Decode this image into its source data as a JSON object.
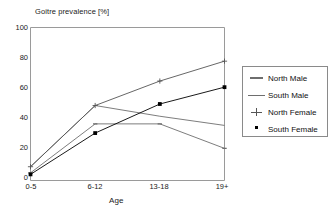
{
  "chart_data": {
    "type": "line",
    "title": "Goitre prevalence [%]",
    "xlabel": "Age",
    "ylabel": "",
    "categories": [
      "0-5",
      "6-12",
      "13-18",
      "19+"
    ],
    "ylim": [
      0,
      100
    ],
    "yticks": [
      0,
      20,
      40,
      60,
      80,
      100
    ],
    "grid": false,
    "legend_position": "right-outside",
    "series": [
      {
        "name": "North Male",
        "values": [
          5,
          37,
          37,
          21
        ],
        "marker": "dash",
        "color": "#6e6e6e"
      },
      {
        "name": "South Male",
        "values": [
          9,
          49,
          42,
          36
        ],
        "marker": "line",
        "color": "#6e6e6e"
      },
      {
        "name": "North Female",
        "values": [
          9,
          49,
          65,
          78
        ],
        "marker": "plus",
        "color": "#555555"
      },
      {
        "name": "South Female",
        "values": [
          4,
          31,
          50,
          61
        ],
        "marker": "square",
        "color": "#000000"
      }
    ]
  },
  "axes": {
    "ytick_labels": [
      "100",
      "80",
      "60",
      "40",
      "20",
      "0"
    ],
    "xtick_labels": [
      "0-5",
      "6-12",
      "13-18",
      "19+"
    ]
  },
  "legend": {
    "items": [
      {
        "label": "North Male"
      },
      {
        "label": "South Male"
      },
      {
        "label": "North Female"
      },
      {
        "label": "South Female"
      }
    ]
  }
}
